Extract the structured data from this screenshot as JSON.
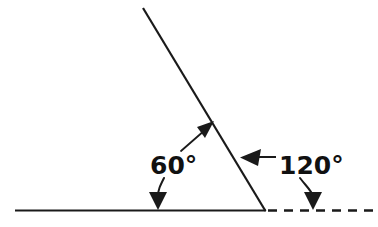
{
  "diagram": {
    "background_color": "#ffffff",
    "stroke_color": "#1a1a1a",
    "labels": [
      {
        "id": "interior-angle",
        "text": "60°",
        "value": 60,
        "unit": "degrees",
        "x": 150,
        "y": 174,
        "color": "#111111"
      },
      {
        "id": "exterior-angle",
        "text": "120°",
        "value": 120,
        "unit": "degrees",
        "x": 279,
        "y": 174,
        "color": "#111111"
      }
    ],
    "lines": [
      {
        "id": "horizontal-solid-ray",
        "style": "solid",
        "x1": 15,
        "y1": 210.5,
        "x2": 265,
        "y2": 210.5,
        "width": 2.2
      },
      {
        "id": "slanted-ray",
        "style": "solid",
        "x1": 143,
        "y1": 8,
        "x2": 265,
        "y2": 210.5,
        "width": 2.2
      },
      {
        "id": "horizontal-dashed-extension",
        "style": "dashed",
        "x1": 267,
        "y1": 210.5,
        "x2": 373,
        "y2": 210.5,
        "width": 2.4,
        "dash": "9 7"
      }
    ],
    "pointers": [
      {
        "id": "interior-angle-to-slanted-ray",
        "from_label": "60°",
        "points_to": "slanted-ray",
        "direction": "up-right",
        "tip_x": 214,
        "tip_y": 122
      },
      {
        "id": "interior-angle-to-horizontal-ray",
        "from_label": "60°",
        "points_to": "horizontal-solid-ray",
        "direction": "down",
        "tip_x": 158,
        "tip_y": 210
      },
      {
        "id": "exterior-angle-to-slanted-ray",
        "from_label": "120°",
        "points_to": "slanted-ray",
        "direction": "left",
        "tip_x": 241,
        "tip_y": 157
      },
      {
        "id": "exterior-angle-to-dashed-extension",
        "from_label": "120°",
        "points_to": "horizontal-dashed-extension",
        "direction": "down",
        "tip_x": 313,
        "tip_y": 210
      }
    ],
    "vertex": {
      "id": "angle-vertex",
      "x": 265,
      "y": 210.5
    }
  }
}
